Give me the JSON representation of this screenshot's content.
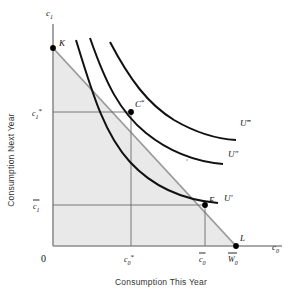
{
  "figure": {
    "type": "economics-indifference-curve-diagram",
    "axis_titles": {
      "x": "Consumption This Year",
      "y": "Consumption Next Year"
    },
    "axis_symbols": {
      "x": "c",
      "x_sub": "0",
      "y": "c",
      "y_sub": "1"
    },
    "origin_label": "0",
    "points": [
      {
        "id": "K",
        "label": "K",
        "x": 53,
        "y": 48,
        "desc": "budget-line y-intercept"
      },
      {
        "id": "Cstar",
        "label": "C",
        "sup": "*",
        "x": 131,
        "y": 112,
        "desc": "optimal-consumption-tangency"
      },
      {
        "id": "E",
        "label": "E",
        "x": 205,
        "y": 205,
        "desc": "endowment-point"
      },
      {
        "id": "L",
        "label": "L",
        "x": 236,
        "y": 246,
        "desc": "budget-line-x-intercept"
      }
    ],
    "tick_labels": {
      "y_star": {
        "base": "c",
        "sub": "1",
        "sup": "*",
        "value_y": 112
      },
      "y_bar": {
        "base": "c",
        "sub": "1",
        "bar": true,
        "value_y": 205
      },
      "x_star": {
        "base": "c",
        "sub": "0",
        "sup": "*",
        "value_x": 131
      },
      "x_bar": {
        "base": "c",
        "sub": "0",
        "bar": true,
        "value_x": 205
      },
      "x_wealth": {
        "base": "W",
        "sub": "0",
        "bar": true,
        "value_x": 236
      }
    },
    "curves": [
      {
        "id": "U1",
        "label": "U",
        "primes": "′",
        "level": 1
      },
      {
        "id": "U2",
        "label": "U",
        "primes": "″",
        "level": 2
      },
      {
        "id": "U3",
        "label": "U",
        "primes": "‴",
        "level": 3
      }
    ],
    "colors": {
      "shaded_region": "#e9e9e9",
      "budget_line": "#8d8d8d",
      "axis": "#8d8d8d",
      "curve": "#111111",
      "guide_line": "#6b6b6b",
      "text": "#111111",
      "axis_title_text": "#333333",
      "point_dot": "#000000"
    },
    "geometry": {
      "x_axis_y": 246,
      "y_axis_x": 53,
      "budget_from": [
        53,
        48
      ],
      "budget_to": [
        236,
        246
      ]
    }
  }
}
